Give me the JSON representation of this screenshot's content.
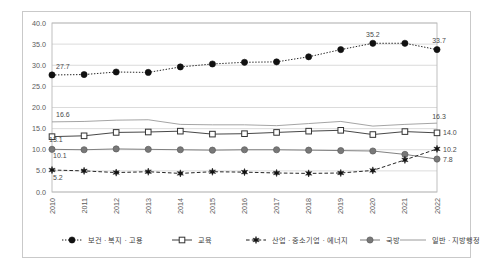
{
  "chart_data": {
    "type": "line",
    "title": "",
    "xlabel": "",
    "ylabel": "",
    "ylim": [
      0.0,
      40.0
    ],
    "yticks": [
      "0.0",
      "5.0",
      "10.0",
      "15.0",
      "20.0",
      "25.0",
      "30.0",
      "35.0",
      "40.0"
    ],
    "grid": true,
    "legend_position": "bottom",
    "categories": [
      "2010",
      "2011",
      "2012",
      "2013",
      "2014",
      "2015",
      "2016",
      "2017",
      "2018",
      "2019",
      "2020",
      "2021",
      "2022"
    ],
    "series": [
      {
        "name": "보건 · 복지 · 고용",
        "marker": "filled-circle",
        "line_style": "dotted",
        "color": "#1a1a1a",
        "values": [
          27.7,
          27.8,
          28.4,
          28.3,
          29.6,
          30.3,
          30.7,
          30.8,
          32.0,
          33.7,
          35.2,
          35.2,
          33.7
        ],
        "labels": {
          "2010": "27.7",
          "2020": "35.2",
          "2022": "33.7"
        }
      },
      {
        "name": "교육",
        "marker": "open-square",
        "line_style": "solid",
        "color": "#3d3d3d",
        "values": [
          13.1,
          13.3,
          14.1,
          14.2,
          14.4,
          13.7,
          13.8,
          14.1,
          14.4,
          14.6,
          13.6,
          14.3,
          14.0
        ],
        "labels": {
          "2010": "13.1",
          "2022": "14.0"
        }
      },
      {
        "name": "산업 · 중소기업 · 에너지",
        "marker": "star",
        "line_style": "dashed",
        "color": "#1a1a1a",
        "values": [
          5.2,
          5.0,
          4.6,
          4.8,
          4.4,
          4.8,
          4.7,
          4.5,
          4.4,
          4.5,
          5.1,
          7.6,
          10.2
        ],
        "labels": {
          "2010": "5.2",
          "2022": "10.2"
        }
      },
      {
        "name": "국방",
        "marker": "filled-circle-gray",
        "line_style": "solid",
        "color": "#7a7a7a",
        "values": [
          10.1,
          10.0,
          10.2,
          10.1,
          10.0,
          9.9,
          10.0,
          10.0,
          9.9,
          9.8,
          9.7,
          8.9,
          7.8
        ],
        "labels": {
          "2010": "10.1",
          "2022": "7.8"
        }
      },
      {
        "name": "일반 · 지방행정",
        "marker": "none",
        "line_style": "solid",
        "color": "#9a9a9a",
        "values": [
          16.6,
          16.7,
          17.0,
          17.1,
          16.0,
          15.9,
          15.9,
          15.7,
          16.2,
          16.7,
          15.6,
          16.0,
          16.3
        ],
        "labels": {
          "2010": "16.6",
          "2022": "16.3"
        }
      }
    ]
  },
  "axis": {
    "y_ticks": [
      {
        "label": "40.0",
        "value": 40.0
      },
      {
        "label": "35.0",
        "value": 35.0
      },
      {
        "label": "30.0",
        "value": 30.0
      },
      {
        "label": "25.0",
        "value": 25.0
      },
      {
        "label": "20.0",
        "value": 20.0
      },
      {
        "label": "15.0",
        "value": 15.0
      },
      {
        "label": "10.0",
        "value": 10.0
      },
      {
        "label": "5.0",
        "value": 5.0
      },
      {
        "label": "0.0",
        "value": 0.0
      }
    ]
  },
  "annotations": [
    {
      "text": "27.7",
      "series": "보건 · 복지 · 고용",
      "at": "2010"
    },
    {
      "text": "35.2",
      "series": "보건 · 복지 · 고용",
      "at": "2020"
    },
    {
      "text": "33.7",
      "series": "보건 · 복지 · 고용",
      "at": "2022"
    },
    {
      "text": "16.6",
      "series": "일반 · 지방행정",
      "at": "2010"
    },
    {
      "text": "16.3",
      "series": "일반 · 지방행정",
      "at": "2022"
    },
    {
      "text": "13.1",
      "series": "교육",
      "at": "2010"
    },
    {
      "text": "14.0",
      "series": "교육",
      "at": "2022"
    },
    {
      "text": "10.1",
      "series": "국방",
      "at": "2010"
    },
    {
      "text": "7.8",
      "series": "국방",
      "at": "2022"
    },
    {
      "text": "5.2",
      "series": "산업 · 중소기업 · 에너지",
      "at": "2010"
    },
    {
      "text": "10.2",
      "series": "산업 · 중소기업 · 에너지",
      "at": "2022"
    }
  ],
  "legend": {
    "items": [
      {
        "label": "보건 · 복지 · 고용",
        "marker": "filled-circle",
        "line_style": "dotted"
      },
      {
        "label": "교육",
        "marker": "open-square",
        "line_style": "solid"
      },
      {
        "label": "산업 · 중소기업 · 에너지",
        "marker": "star",
        "line_style": "dashed"
      },
      {
        "label": "국방",
        "marker": "filled-circle-gray",
        "line_style": "solid"
      },
      {
        "label": "일반 · 지방행정",
        "marker": "none",
        "line_style": "solid"
      }
    ]
  }
}
